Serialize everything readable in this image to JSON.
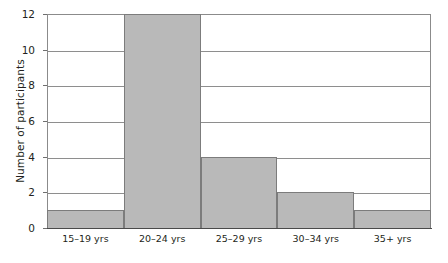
{
  "chart_data": {
    "type": "bar",
    "title": "",
    "subtitle": "",
    "xlabel": "",
    "ylabel": "Number of participants",
    "categories": [
      "15–19 yrs",
      "20–24 yrs",
      "25–29 yrs",
      "30–34 yrs",
      "35+ yrs"
    ],
    "values": [
      1,
      12,
      4,
      2,
      1
    ],
    "ylim": [
      0,
      12
    ],
    "ytick_labels": [
      "0",
      "2",
      "4",
      "6",
      "8",
      "10",
      "12"
    ],
    "ytick_values": [
      0,
      2,
      4,
      6,
      8,
      10,
      12
    ],
    "grid": "horizontal",
    "legend": "none",
    "bar_style": "histogram-adjacent",
    "colors": {
      "bar_fill": "#b9b9b9",
      "bar_edge": "#7c7c7c",
      "gridline": "#8e8e8e",
      "frame": "#8b8b8b",
      "axis": "#4a4a4a",
      "text": "#231f20",
      "background": "#ffffff"
    }
  }
}
